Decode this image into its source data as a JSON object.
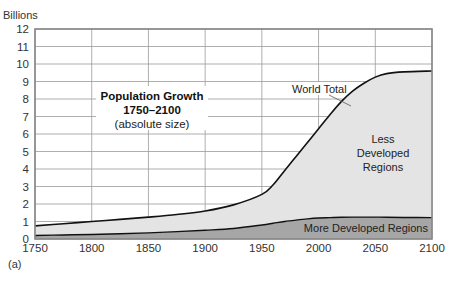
{
  "chart_data": {
    "type": "area",
    "title": "Population Growth",
    "subtitle": "1750–2100",
    "subtitle2": "(absolute size)",
    "xlabel": "",
    "ylabel": "Billions",
    "panel_label": "(a)",
    "xlim": [
      1750,
      2100
    ],
    "ylim": [
      0,
      12
    ],
    "grid": true,
    "x_ticks": [
      1750,
      1800,
      1850,
      1900,
      1950,
      2000,
      2050,
      2100
    ],
    "y_ticks": [
      0,
      1,
      2,
      3,
      4,
      5,
      6,
      7,
      8,
      9,
      10,
      11,
      12
    ],
    "x": [
      1750,
      1775,
      1800,
      1825,
      1850,
      1875,
      1900,
      1925,
      1950,
      1960,
      1970,
      1980,
      1990,
      2000,
      2010,
      2020,
      2030,
      2040,
      2050,
      2060,
      2075,
      2100
    ],
    "series": [
      {
        "name": "More Developed Regions",
        "color": "#a6a6a6",
        "values": [
          0.2,
          0.23,
          0.26,
          0.3,
          0.35,
          0.42,
          0.5,
          0.6,
          0.8,
          0.9,
          1.0,
          1.08,
          1.15,
          1.2,
          1.22,
          1.24,
          1.25,
          1.25,
          1.25,
          1.24,
          1.23,
          1.22
        ]
      },
      {
        "name": "World Total",
        "color": "#e4e4e4",
        "values": [
          0.75,
          0.87,
          1.0,
          1.12,
          1.25,
          1.4,
          1.6,
          1.95,
          2.55,
          3.1,
          3.9,
          4.7,
          5.5,
          6.3,
          7.1,
          7.85,
          8.45,
          8.9,
          9.25,
          9.45,
          9.55,
          9.6
        ]
      }
    ],
    "annotations": [
      {
        "text": "World Total",
        "x": 1965,
        "y": 8.6
      },
      {
        "text": "Less",
        "x": 2065,
        "y": 5.7
      },
      {
        "text": "Developed",
        "x": 2065,
        "y": 4.85
      },
      {
        "text": "Regions",
        "x": 2065,
        "y": 4.0
      },
      {
        "text": "More Developed Regions",
        "x": 2040,
        "y": 0.55
      }
    ]
  }
}
